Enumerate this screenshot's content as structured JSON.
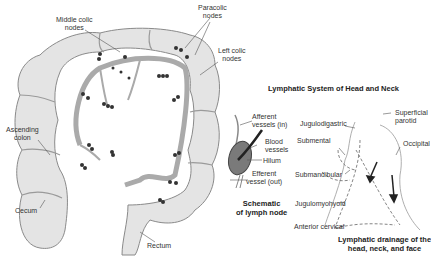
{
  "colon_diagram": {
    "labels": {
      "middle_colic": "Middle colic\nnodes",
      "paracolic": "Paracolic\nnodes",
      "left_colic": "Left colic\nnodes",
      "ascending_colon": "Ascending\ncolon",
      "cecum": "Cecum",
      "rectum": "Rectum"
    }
  },
  "head_neck": {
    "title": "Lymphatic System of Head and Neck",
    "lymph_node": {
      "afferent": "Afferent\nvessels (in)",
      "blood": "Blood\nvessels",
      "hilum": "Hilum",
      "efferent": "Efferent\nvessel (out)",
      "caption": "Schematic\nof lymph node"
    },
    "drainage": {
      "jugulodigastric": "Jugulodigastric",
      "superficial_parotid": "Superficial\nparotid",
      "submental": "Submental",
      "occipital": "Occipital",
      "submandibular": "Submandibular",
      "jugulomyohyoid": "Jugulomyohyoid",
      "anterior_cervical": "Anterior cervical",
      "caption": "Lymphatic drainage of the\nhead, neck, and face"
    }
  },
  "colors": {
    "colon_fill": "#e4e4e4",
    "colon_stroke": "#8a8a8a",
    "vessel": "#9a9a9a",
    "node": "#333333"
  }
}
